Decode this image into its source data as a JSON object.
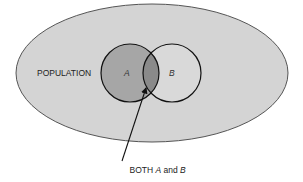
{
  "diagram": {
    "type": "venn",
    "population": {
      "label": "POPULATION",
      "fill": "#d4d4d4",
      "stroke": "#555555"
    },
    "sets": [
      {
        "id": "A",
        "label": "A",
        "fill": "#a6a6a6",
        "stroke": "#111111"
      },
      {
        "id": "B",
        "label": "B",
        "fill": "#d9d9d9",
        "stroke": "#111111"
      }
    ],
    "intersection": {
      "fill": "#8a8a8a"
    },
    "annotation": {
      "prefix": "BOTH ",
      "set_a": "A",
      "middle": " and ",
      "set_b": "B",
      "arrow_color": "#111111"
    }
  }
}
